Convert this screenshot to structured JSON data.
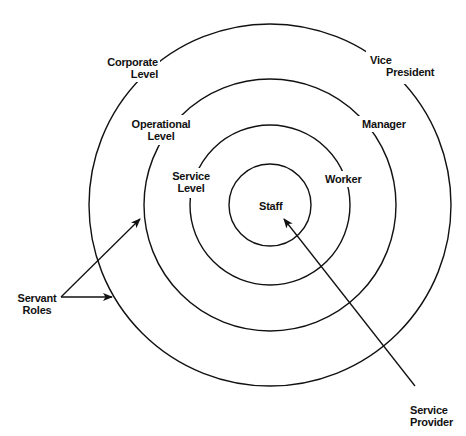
{
  "colors": {
    "stroke": "#111111",
    "background": "#ffffff"
  },
  "rings": [
    {
      "name": "outer",
      "r": 181,
      "left_label": [
        "Corporate",
        "Level"
      ],
      "right_label": [
        "Vice",
        "President"
      ]
    },
    {
      "name": "third",
      "r": 126,
      "left_label": [
        "Operational",
        "Level"
      ],
      "right_label": [
        "Manager"
      ]
    },
    {
      "name": "second",
      "r": 80,
      "left_label": [
        "Service",
        "Level"
      ],
      "right_label": [
        "Worker"
      ]
    },
    {
      "name": "inner",
      "r": 41,
      "center_label": [
        "Staff"
      ]
    }
  ],
  "labels": {
    "corporate_level": {
      "line1": "Corporate",
      "line2": "Level"
    },
    "vice_president": {
      "line1": "Vice",
      "line2": "President"
    },
    "operational_level": {
      "line1": "Operational",
      "line2": "Level"
    },
    "manager": {
      "line1": "Manager"
    },
    "service_level": {
      "line1": "Service",
      "line2": "Level"
    },
    "worker": {
      "line1": "Worker"
    },
    "staff": {
      "line1": "Staff"
    },
    "servant_roles": {
      "line1": "Servant",
      "line2": "Roles"
    },
    "service_provider": {
      "line1": "Service",
      "line2": "Provider"
    }
  },
  "arrows": [
    {
      "name": "servant-roles-to-operational",
      "from": [
        61,
        297
      ],
      "to": [
        141,
        218
      ]
    },
    {
      "name": "servant-roles-to-corporate",
      "from": [
        61,
        297
      ],
      "to": [
        113,
        297
      ]
    },
    {
      "name": "service-provider-to-staff",
      "from": [
        415,
        386
      ],
      "to": [
        283,
        217
      ]
    }
  ]
}
